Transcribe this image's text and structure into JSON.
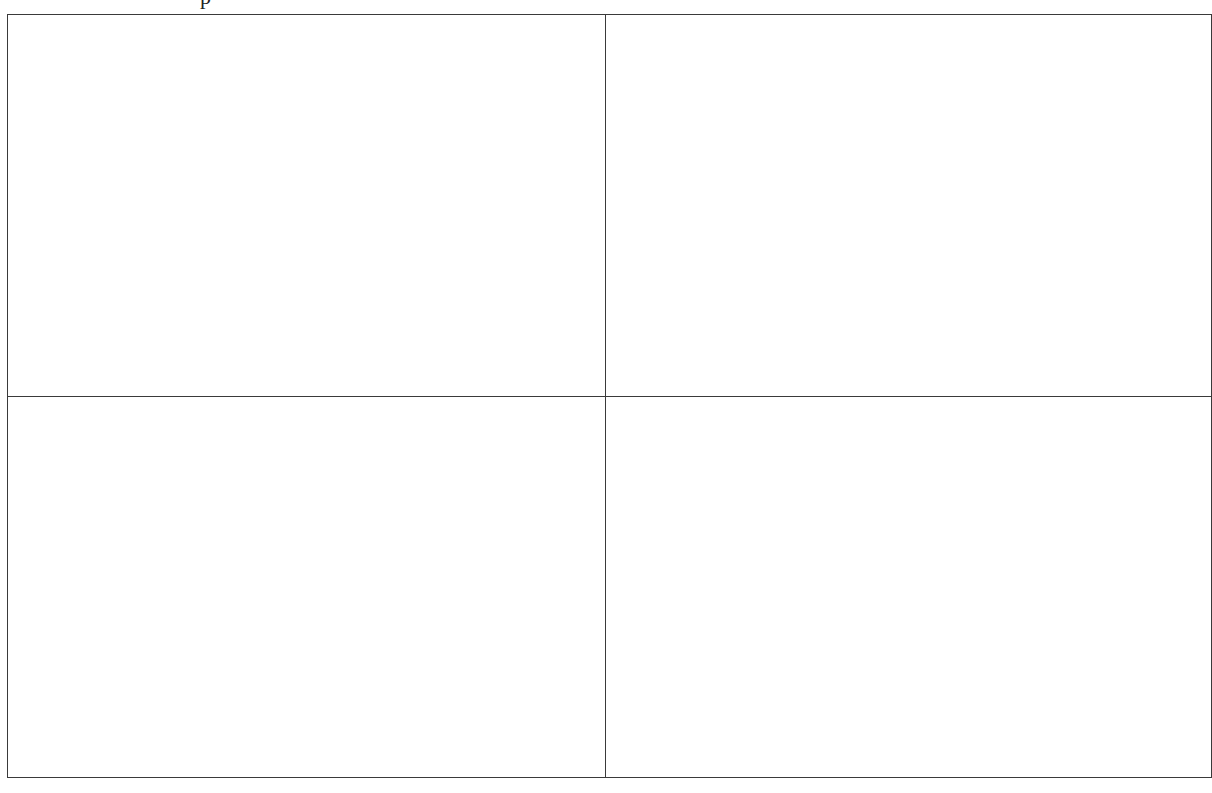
{
  "header": {
    "cropped_text": "p"
  },
  "table": {
    "rows": [
      [
        "",
        ""
      ],
      [
        "",
        ""
      ]
    ],
    "border_color": "#3a3a3a"
  }
}
